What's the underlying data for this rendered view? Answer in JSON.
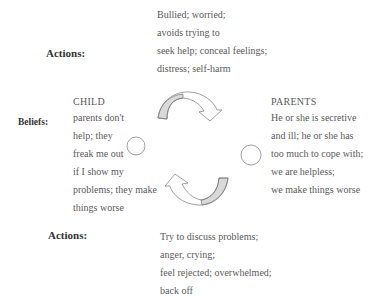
{
  "top_actions": {
    "label": "Actions:",
    "lines": [
      "Bullied; worried;",
      "avoids  trying to",
      "seek help; conceal feelings;",
      "distress; self-harm"
    ]
  },
  "beliefs_label": "Beliefs:",
  "child": {
    "heading": "CHILD",
    "lines": [
      "parents don't",
      "help; they",
      "freak me out",
      "if I show my",
      "problems; they make",
      "things worse"
    ]
  },
  "parents": {
    "heading": "PARENTS",
    "lines": [
      "He or she is secretive",
      "and ill; he or she has",
      "too much to cope with;",
      "we are helpless;",
      "we make things worse"
    ]
  },
  "bottom_actions": {
    "label": "Actions:",
    "lines": [
      "Try to discuss problems;",
      "anger, crying;",
      "feel rejected; overwhelmed;",
      "back off"
    ]
  },
  "colors": {
    "arrow_fill": "#d9d9d9",
    "arrow_stroke": "#777777",
    "text": "#5a5a5a",
    "label": "#333333"
  }
}
